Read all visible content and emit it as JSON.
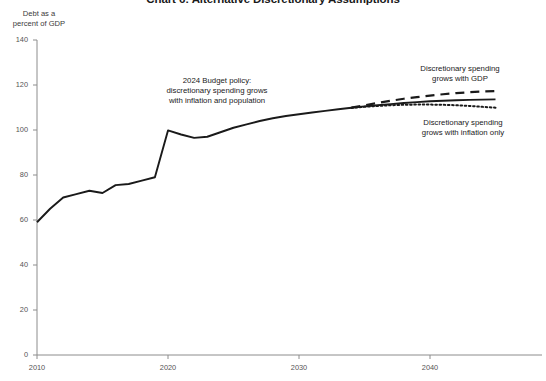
{
  "title": "Chart 6: Alternative Discretionary Assumptions",
  "axis_title_line1": "Debt as a",
  "axis_title_line2": "percent of GDP",
  "annotations": {
    "budget_policy": {
      "line1": "2024 Budget policy:",
      "line2": "discretionary spending grows",
      "line3": "with inflation and population"
    },
    "gdp": {
      "line1": "Discretionary spending",
      "line2": "grows with GDP"
    },
    "inflation": {
      "line1": "Discretionary spending",
      "line2": "grows with inflation only"
    }
  },
  "colors": {
    "line": "#1a1a1a",
    "axis": "#8c8c8c",
    "text": "#333333"
  },
  "chart_data": {
    "type": "line",
    "title": "Chart 6: Alternative Discretionary Assumptions",
    "xlabel": "",
    "ylabel": "Debt as a percent of GDP",
    "xlim": [
      2008,
      2046
    ],
    "ylim": [
      0,
      140
    ],
    "ytick_labels": [
      "0",
      "20",
      "40",
      "60",
      "80",
      "100",
      "120",
      "140"
    ],
    "yticks": [
      0,
      20,
      40,
      60,
      80,
      100,
      120,
      140
    ],
    "xtick_labels": [
      "2010",
      "2020",
      "2030",
      "2040"
    ],
    "xticks": [
      2010,
      2020,
      2030,
      2040
    ],
    "grid": false,
    "legend_position": "inline-annotations",
    "series": [
      {
        "name": "2024 Budget policy: discretionary spending grows with inflation and population",
        "style": "solid",
        "x": [
          2010,
          2011,
          2012,
          2013,
          2014,
          2015,
          2016,
          2017,
          2018,
          2019,
          2020,
          2021,
          2022,
          2023,
          2024,
          2025,
          2026,
          2027,
          2028,
          2029,
          2030,
          2031,
          2032,
          2033,
          2034,
          2035,
          2036,
          2037,
          2038,
          2039,
          2040,
          2041,
          2042,
          2043,
          2044,
          2045
        ],
        "values": [
          59.0,
          65.0,
          70.0,
          71.5,
          73.0,
          72.0,
          75.5,
          76.0,
          77.5,
          79.0,
          99.8,
          98.0,
          96.5,
          97.0,
          99.0,
          101.0,
          102.5,
          104.0,
          105.2,
          106.2,
          107.0,
          107.8,
          108.5,
          109.2,
          109.9,
          110.5,
          111.0,
          111.5,
          112.0,
          112.4,
          112.8,
          113.0,
          113.2,
          113.4,
          113.5,
          113.6
        ]
      },
      {
        "name": "Discretionary spending grows with GDP",
        "style": "dashed",
        "x": [
          2034,
          2035,
          2036,
          2037,
          2038,
          2039,
          2040,
          2041,
          2042,
          2043,
          2044,
          2045
        ],
        "values": [
          110.0,
          111.0,
          112.0,
          113.0,
          113.9,
          114.6,
          115.3,
          115.9,
          116.4,
          116.8,
          117.1,
          117.3
        ]
      },
      {
        "name": "Discretionary spending grows with inflation only",
        "style": "dotted",
        "x": [
          2034,
          2035,
          2036,
          2037,
          2038,
          2039,
          2040,
          2041,
          2042,
          2043,
          2044,
          2045
        ],
        "values": [
          109.8,
          110.3,
          110.7,
          111.0,
          111.2,
          111.3,
          111.3,
          111.2,
          111.0,
          110.7,
          110.3,
          109.9
        ]
      }
    ]
  }
}
